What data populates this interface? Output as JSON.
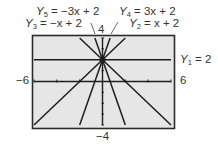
{
  "chart_data": {
    "type": "line",
    "title": "",
    "xlabel": "",
    "ylabel": "",
    "xlim": [
      -6,
      6
    ],
    "ylim": [
      -4,
      4
    ],
    "grid": false,
    "window_labels": {
      "xmin": "−6",
      "xmax": "6",
      "ymin": "−4",
      "ymax": "4"
    },
    "series": [
      {
        "name": "Y1",
        "label": "Y1 = 2",
        "equation": "y = 2",
        "slope": 0,
        "intercept": 2
      },
      {
        "name": "Y2",
        "label": "Y2 = x + 2",
        "equation": "y = x + 2",
        "slope": 1,
        "intercept": 2
      },
      {
        "name": "Y3",
        "label": "Y3 = −x + 2",
        "equation": "y = -x + 2",
        "slope": -1,
        "intercept": 2
      },
      {
        "name": "Y4",
        "label": "Y4 = 3x + 2",
        "equation": "y = 3x + 2",
        "slope": 3,
        "intercept": 2
      },
      {
        "name": "Y5",
        "label": "Y5 = −3x + 2",
        "equation": "y = -3x + 2",
        "slope": -3,
        "intercept": 2
      }
    ],
    "common_point": [
      0,
      2
    ],
    "x_ticks": [
      -6,
      -5,
      -4,
      -3,
      -2,
      -1,
      0,
      1,
      2,
      3,
      4,
      5,
      6
    ],
    "y_ticks": [
      -4,
      -3,
      -2,
      -1,
      0,
      1,
      2,
      3,
      4
    ]
  },
  "labels": {
    "y5": {
      "name": "Y",
      "sub": "5",
      "rhs": " = −3x + 2"
    },
    "y3": {
      "name": "Y",
      "sub": "3",
      "rhs": " = −x + 2"
    },
    "y4": {
      "name": "Y",
      "sub": "4",
      "rhs": " = 3x + 2"
    },
    "y2": {
      "name": "Y",
      "sub": "2",
      "rhs": " = x + 2"
    },
    "y1": {
      "name": "Y",
      "sub": "1",
      "rhs": " = 2"
    },
    "ymax": "4",
    "ymin": "−4",
    "xmin": "−6",
    "xmax": "6"
  },
  "colors": {
    "screen_bg": "#e6e6e6",
    "frame": "#2b2b2b",
    "line": "#1e1e1e"
  }
}
